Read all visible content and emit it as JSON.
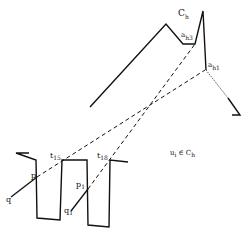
{
  "diagram": {
    "labels": {
      "C": "C",
      "C_sub": "h",
      "ah3": "a",
      "ah3_sub": "h3",
      "ah1": "a",
      "ah1_sub": "h1",
      "t15": "t",
      "t15_sub": "15",
      "t18": "t",
      "t18_sub": "18",
      "p": "p",
      "p1": "p",
      "p1_sub": "1",
      "q": "q",
      "q1": "q",
      "q1_sub": "1",
      "membership": "u",
      "membership_sub": "i",
      "membership_rel": "∈ C",
      "membership_rel_sub": "h"
    },
    "colors": {
      "stroke": "#111111",
      "background": "#ffffff"
    }
  }
}
